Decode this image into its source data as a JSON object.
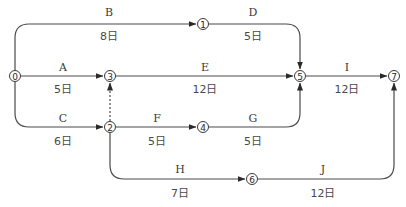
{
  "diagram": {
    "type": "arrow-diagram",
    "caption_cut_off": "",
    "nodes": [
      {
        "id": "0",
        "label": "0",
        "x": 15,
        "y": 76
      },
      {
        "id": "1",
        "label": "1",
        "x": 203,
        "y": 24
      },
      {
        "id": "2",
        "label": "2",
        "x": 110,
        "y": 127
      },
      {
        "id": "3",
        "label": "3",
        "x": 110,
        "y": 76
      },
      {
        "id": "4",
        "label": "4",
        "x": 203,
        "y": 127
      },
      {
        "id": "5",
        "label": "5",
        "x": 300,
        "y": 76
      },
      {
        "id": "6",
        "label": "6",
        "x": 252,
        "y": 179
      },
      {
        "id": "7",
        "label": "7",
        "x": 394,
        "y": 76
      }
    ],
    "activities": [
      {
        "name": "A",
        "duration": "5日",
        "from": "0",
        "to": "3"
      },
      {
        "name": "B",
        "duration": "8日",
        "from": "0",
        "to": "1"
      },
      {
        "name": "C",
        "duration": "6日",
        "from": "0",
        "to": "2"
      },
      {
        "name": "D",
        "duration": "5日",
        "from": "1",
        "to": "5"
      },
      {
        "name": "E",
        "duration": "12日",
        "from": "3",
        "to": "5"
      },
      {
        "name": "F",
        "duration": "5日",
        "from": "2",
        "to": "4"
      },
      {
        "name": "G",
        "duration": "5日",
        "from": "4",
        "to": "5"
      },
      {
        "name": "H",
        "duration": "7日",
        "from": "2",
        "to": "6"
      },
      {
        "name": "I",
        "duration": "12日",
        "from": "5",
        "to": "7"
      },
      {
        "name": "J",
        "duration": "12日",
        "from": "6",
        "to": "7"
      }
    ],
    "dummy_activities": [
      {
        "from": "2",
        "to": "3",
        "style": "dashed"
      }
    ],
    "colors": {
      "line": "#4a4a4a",
      "text": "#3a3a3a",
      "background": "#ffffff"
    }
  }
}
